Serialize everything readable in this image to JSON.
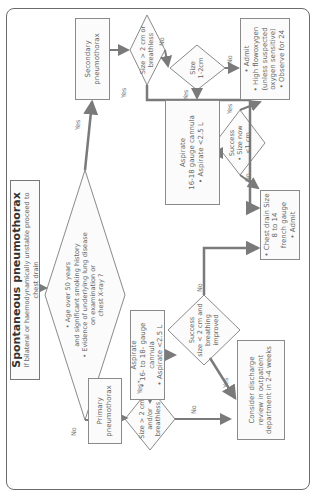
{
  "title": {
    "main": "Spontaneous pneumothorax",
    "sub": "If bilateral or haemodynamically unstable proceed to chest drain"
  },
  "main_decision": {
    "line1": "• Age over 50 years",
    "line2": "and significant smoking history",
    "line3": "• Evidence of underlying lung disease",
    "line4": "on examination or",
    "line5": "chest X-ray ?"
  },
  "secondary": {
    "box": {
      "line1": "Secondary",
      "line2": "pneumothorax"
    },
    "size_decision": {
      "line1": "Size > 2 cm or",
      "line2": "breathless"
    },
    "size12_decision": {
      "line1": "Size",
      "line2": "1-2cm"
    },
    "admit_box": {
      "line1": "• Admit",
      "line2": "• High flowoxygen",
      "line3": "(unless suspected",
      "line4": "oxygen sensitive)",
      "line5": "• Observe for 24"
    },
    "aspirate_box": {
      "line1": "Aspirate",
      "line2": "16-18 gauge cannula",
      "line3": "• Aspirate <2.5 L"
    },
    "success_decision": {
      "line1": "Success",
      "line2": "• Size now",
      "line3": "<1 cm"
    }
  },
  "primary": {
    "box": {
      "line1": "Primary",
      "line2": "pneumothorax"
    },
    "size_decision": {
      "line1": "Size > 2 cm",
      "line2": "and/or breathless"
    },
    "aspirate_box": {
      "line1": "Aspirate",
      "line2": "• 16- to 18- gauge cannula",
      "line3": "• Aspirate <2.5 L"
    },
    "success_decision": {
      "line1": "Success",
      "line2": "size < 2 cm and",
      "line3": "breathing",
      "line4": "improved"
    },
    "discharge_box": {
      "line1": "Consider discharge",
      "line2": "review in outpatient",
      "line3": "department in 2-4 weeks"
    }
  },
  "chest_drain_box": {
    "line1": "• Chest drain Size 8 to 14",
    "line2": "french gauge",
    "line3": "• Admit"
  },
  "edge_labels": {
    "main_yes": "Yes",
    "main_no": "No",
    "sec_size_yes": "Yes",
    "sec_size_no": "No",
    "size12_yes": "Yes",
    "size12_no": "No",
    "sec_success_yes": "Yes",
    "sec_success_no": "No",
    "pri_size_yes": "Yes*",
    "pri_size_no": "No",
    "pri_success_yes": "Yes",
    "pri_success_no": "No"
  },
  "colors": {
    "arrow": "#7a7a7a",
    "border": "#8a8a8a",
    "frame": "#6b6b6b",
    "text": "#666666",
    "title_text": "#333333"
  }
}
